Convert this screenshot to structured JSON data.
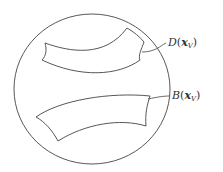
{
  "diagram": {
    "type": "set-region-illustration",
    "outer_region": {
      "shape": "circle",
      "stroke": "#444444"
    },
    "regions": [
      {
        "id": "D",
        "label_letter": "D",
        "label_arg": "x",
        "label_sub": "V",
        "label_full": "D(x_V)"
      },
      {
        "id": "B",
        "label_letter": "B",
        "label_arg": "x",
        "label_sub": "V",
        "label_full": "B(x_V)"
      }
    ]
  },
  "labels": {
    "d": {
      "letter": "D",
      "open": "(",
      "arg": "x",
      "sub": "V",
      "close": ")"
    },
    "b": {
      "letter": "B",
      "open": "(",
      "arg": "x",
      "sub": "V",
      "close": ")"
    }
  },
  "colors": {
    "stroke": "#444444",
    "background": "#ffffff",
    "text": "#333333"
  }
}
